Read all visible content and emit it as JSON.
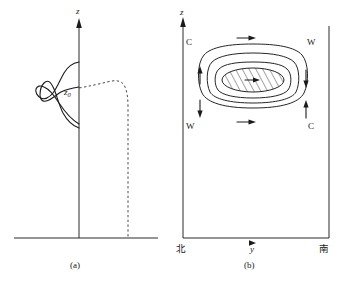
{
  "figure": {
    "panels": [
      {
        "id": "a",
        "caption": "(a)",
        "axis_label_vertical": "z",
        "level_label": "z",
        "level_label_sub": "0",
        "curves": [
          {
            "name": "narrow-profile",
            "style": "solid"
          },
          {
            "name": "broad-profile",
            "style": "solid"
          },
          {
            "name": "reference-profile",
            "style": "dashed"
          }
        ]
      },
      {
        "id": "b",
        "caption": "(b)",
        "axis_label_vertical": "z",
        "axis_label_horizontal": "y",
        "axis_label_left_end": "北",
        "axis_label_right_end": "南",
        "circulation_labels": [
          {
            "name": "top-left",
            "text": "C"
          },
          {
            "name": "top-right",
            "text": "W"
          },
          {
            "name": "bottom-left",
            "text": "W"
          },
          {
            "name": "bottom-right",
            "text": "C"
          }
        ],
        "flow_arrows": [
          {
            "name": "top-arrow",
            "direction": "right"
          },
          {
            "name": "bottom-arrow",
            "direction": "right"
          },
          {
            "name": "left-outer-arrow",
            "direction": "up"
          },
          {
            "name": "left-lower-arrow",
            "direction": "down"
          },
          {
            "name": "right-outer-arrow",
            "direction": "down"
          },
          {
            "name": "right-lower-arrow",
            "direction": "up"
          },
          {
            "name": "core-arrow",
            "direction": "right"
          }
        ],
        "contours": 3,
        "core_fill": "hatched"
      }
    ]
  },
  "colors": {
    "ink": "#1a1a1a",
    "axis": "#2b2b2b",
    "dashed": "#4a4a4a",
    "background": "#ffffff"
  }
}
